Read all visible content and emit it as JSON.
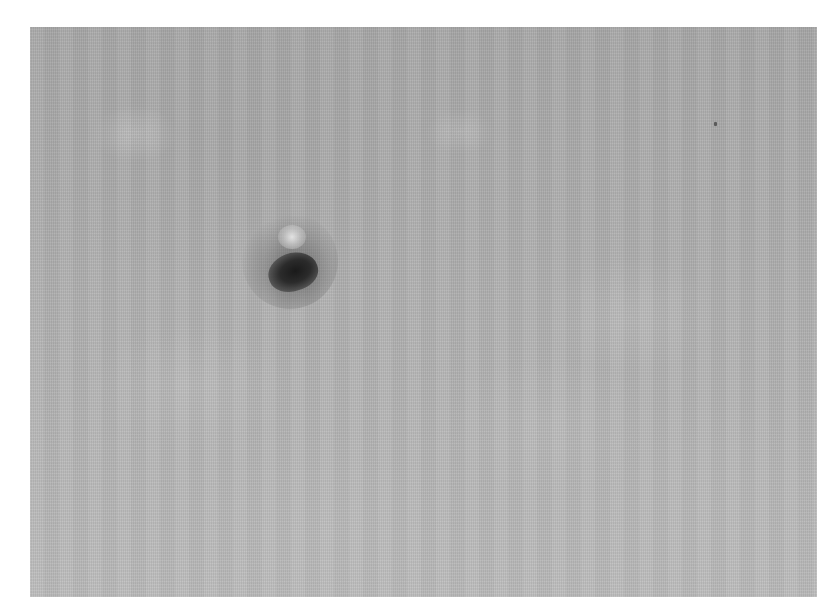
{
  "image": {
    "kind": "grayscale micrograph",
    "background_color": "#ffffff",
    "field_color": "#b0b0b0",
    "objects": [
      {
        "name": "dark-particle",
        "color": "#1a1a1a",
        "highlight_color": "#e6e6e6"
      },
      {
        "name": "small-speck",
        "color": "#5a5a5a"
      }
    ]
  }
}
